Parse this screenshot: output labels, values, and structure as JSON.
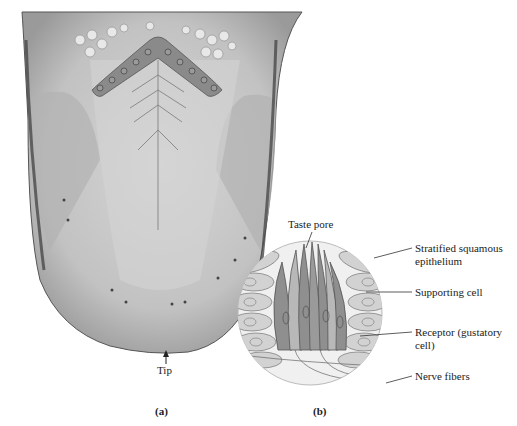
{
  "figure": {
    "panel_a": {
      "caption": "(a)",
      "labels": {
        "tip": "Tip"
      }
    },
    "panel_b": {
      "caption": "(b)",
      "labels": {
        "taste_pore": "Taste pore",
        "stratified_line1": "Stratified squamous",
        "stratified_line2": "epithelium",
        "supporting_cell": "Supporting cell",
        "receptor_line1": "Receptor (gustatory",
        "receptor_line2": "cell)",
        "nerve_fibers": "Nerve fibers"
      }
    },
    "colors": {
      "tongue_base": "#c8c8c8",
      "tongue_edge": "#6e6e6e",
      "vallate_band": "#8a8a8a",
      "receptor_cell": "#8f8f8f",
      "epithelium_cell": "#d2d2d2"
    }
  }
}
